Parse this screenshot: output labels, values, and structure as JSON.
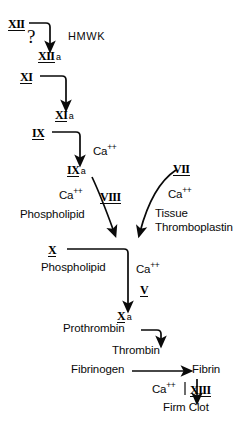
{
  "diagram": {
    "background_color": "#ffffff",
    "ink_color": "#0a0a0a"
  },
  "factors": {
    "xii": "XII",
    "xii_a": "XII",
    "xii_a_suffix": "a",
    "xi": "XI",
    "xi_a": "XI",
    "xi_a_suffix": "a",
    "ix": "IX",
    "ix_a": "IX",
    "ix_a_suffix": "a",
    "viii": "VIII",
    "vii": "VII",
    "x": "X",
    "x_a": "X",
    "x_a_suffix": "a",
    "v": "V",
    "xiii": "XIII"
  },
  "cofactors": {
    "hmwk": "HMWK",
    "question_mark": "?",
    "calcium_top": "Ca",
    "calcium_top_charge": "++",
    "calcium_viii": "Ca",
    "calcium_viii_charge": "++",
    "calcium_vii": "Ca",
    "calcium_vii_charge": "++",
    "calcium_x": "Ca",
    "calcium_x_charge": "++",
    "calcium_xiii": "Ca",
    "calcium_xiii_charge": "++",
    "phospholipid_upper": "Phospholipid",
    "phospholipid_lower": "Phospholipid",
    "tissue_line1": "Tissue",
    "tissue_line2": "Thromboplastin"
  },
  "products": {
    "prothrombin": "Prothrombin",
    "thrombin": "Thrombin",
    "fibrinogen": "Fibrinogen",
    "fibrin": "Fibrin",
    "firm_clot": "Firm Clot"
  }
}
